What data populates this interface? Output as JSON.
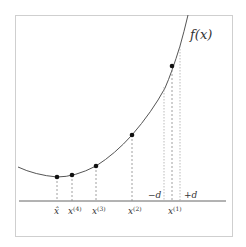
{
  "figure": {
    "function_label": "f(x)",
    "minus_d_label": "−d",
    "plus_d_label": "+d",
    "frame_color": "#cfcfcf",
    "curve_color": "#555555",
    "axis_color": "#666666",
    "point_color": "#111111",
    "points": [
      {
        "label_base": "x̂",
        "label_sup": "",
        "x": 57,
        "y": 177
      },
      {
        "label_base": "x",
        "label_sup": "(4)",
        "x": 72,
        "y": 175
      },
      {
        "label_base": "x",
        "label_sup": "(3)",
        "x": 96,
        "y": 166
      },
      {
        "label_base": "x",
        "label_sup": "(2)",
        "x": 132,
        "y": 135
      },
      {
        "label_base": "x",
        "label_sup": "(1)",
        "x": 172,
        "y": 66
      }
    ]
  }
}
